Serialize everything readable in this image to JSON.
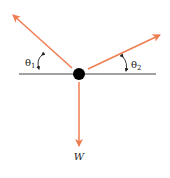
{
  "diagram": {
    "type": "free-body-diagram",
    "colors": {
      "force": "#f07d52",
      "line": "#444444",
      "node": "#000000"
    },
    "labels": {
      "theta1": "θ",
      "theta1_sub": "1",
      "theta2": "θ",
      "theta2_sub": "2",
      "weight": "W"
    },
    "forces": [
      {
        "name": "tension-left",
        "direction": "up-left"
      },
      {
        "name": "tension-right",
        "direction": "up-right"
      },
      {
        "name": "weight",
        "direction": "down"
      }
    ]
  }
}
